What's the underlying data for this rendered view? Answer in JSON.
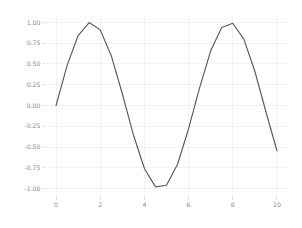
{
  "chart_data": {
    "type": "line",
    "title": "",
    "subtitle": "",
    "xlabel": "",
    "ylabel": "",
    "xlim": [
      -0.5,
      10.5
    ],
    "ylim": [
      -1.1,
      1.1
    ],
    "grid": true,
    "legend": null,
    "legend_position": "none",
    "line_color": "#595959",
    "grid_color": "#eceff1",
    "background_color": "#ffffff",
    "tick_label_color": "#8a8a8a",
    "xticks": [
      0,
      2,
      4,
      6,
      8,
      10
    ],
    "xtick_labels": [
      "0",
      "2",
      "4",
      "6",
      "8",
      "10"
    ],
    "yticks": [
      1.0,
      0.75,
      0.5,
      0.25,
      0.0,
      -0.25,
      -0.5,
      -0.75,
      -1.0
    ],
    "ytick_labels": [
      "1.00",
      "0.75",
      "0.50",
      "0.25",
      "0.00",
      "-0.25",
      "-0.50",
      "-0.75",
      "-1.00"
    ],
    "series": [
      {
        "name": "sin(x)",
        "x": [
          0,
          0.5,
          1.0,
          1.5,
          2.0,
          2.5,
          3.0,
          3.5,
          4.0,
          4.5,
          5.0,
          5.5,
          6.0,
          6.5,
          7.0,
          7.5,
          8.0,
          8.5,
          9.0,
          9.5,
          10.0
        ],
        "values": [
          0.0,
          0.479,
          0.841,
          0.997,
          0.909,
          0.599,
          0.141,
          -0.351,
          -0.757,
          -0.978,
          -0.959,
          -0.706,
          -0.279,
          0.215,
          0.657,
          0.938,
          0.989,
          0.798,
          0.412,
          -0.075,
          -0.544
        ]
      }
    ]
  }
}
